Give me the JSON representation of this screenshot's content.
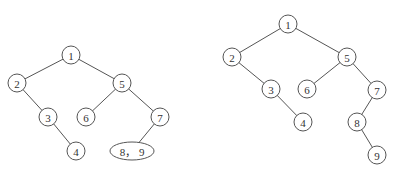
{
  "diagrams": [
    {
      "name": "left-tree",
      "nodes": [
        {
          "id": "1",
          "label": "1",
          "x": 71,
          "y": 55,
          "shape": "circle"
        },
        {
          "id": "2",
          "label": "2",
          "x": 17,
          "y": 83,
          "shape": "circle"
        },
        {
          "id": "5",
          "label": "5",
          "x": 122,
          "y": 83,
          "shape": "circle"
        },
        {
          "id": "3",
          "label": "3",
          "x": 48,
          "y": 117,
          "shape": "circle"
        },
        {
          "id": "6",
          "label": "6",
          "x": 86,
          "y": 117,
          "shape": "circle"
        },
        {
          "id": "7",
          "label": "7",
          "x": 160,
          "y": 117,
          "shape": "circle"
        },
        {
          "id": "4",
          "label": "4",
          "x": 76,
          "y": 151,
          "shape": "circle"
        },
        {
          "id": "89",
          "label": "8， 9",
          "x": 132,
          "y": 151,
          "shape": "ellipse"
        }
      ],
      "edges": [
        [
          "1",
          "2"
        ],
        [
          "1",
          "5"
        ],
        [
          "2",
          "3"
        ],
        [
          "3",
          "4"
        ],
        [
          "5",
          "6"
        ],
        [
          "5",
          "7"
        ],
        [
          "7",
          "89"
        ]
      ]
    },
    {
      "name": "right-tree",
      "nodes": [
        {
          "id": "1",
          "label": "1",
          "x": 288,
          "y": 24,
          "shape": "circle"
        },
        {
          "id": "2",
          "label": "2",
          "x": 232,
          "y": 57,
          "shape": "circle"
        },
        {
          "id": "5",
          "label": "5",
          "x": 347,
          "y": 57,
          "shape": "circle"
        },
        {
          "id": "3",
          "label": "3",
          "x": 271,
          "y": 89,
          "shape": "circle"
        },
        {
          "id": "6",
          "label": "6",
          "x": 307,
          "y": 89,
          "shape": "circle"
        },
        {
          "id": "7",
          "label": "7",
          "x": 377,
          "y": 90,
          "shape": "circle"
        },
        {
          "id": "4",
          "label": "4",
          "x": 303,
          "y": 122,
          "shape": "circle"
        },
        {
          "id": "8",
          "label": "8",
          "x": 357,
          "y": 122,
          "shape": "circle"
        },
        {
          "id": "9",
          "label": "9",
          "x": 377,
          "y": 155,
          "shape": "circle"
        }
      ],
      "edges": [
        [
          "1",
          "2"
        ],
        [
          "1",
          "5"
        ],
        [
          "2",
          "3"
        ],
        [
          "3",
          "4"
        ],
        [
          "5",
          "6"
        ],
        [
          "5",
          "7"
        ],
        [
          "7",
          "8"
        ],
        [
          "8",
          "9"
        ]
      ]
    }
  ],
  "style": {
    "stroke": "#555555",
    "node_radius": 9,
    "ellipse_rx": 22,
    "ellipse_ry": 9
  }
}
